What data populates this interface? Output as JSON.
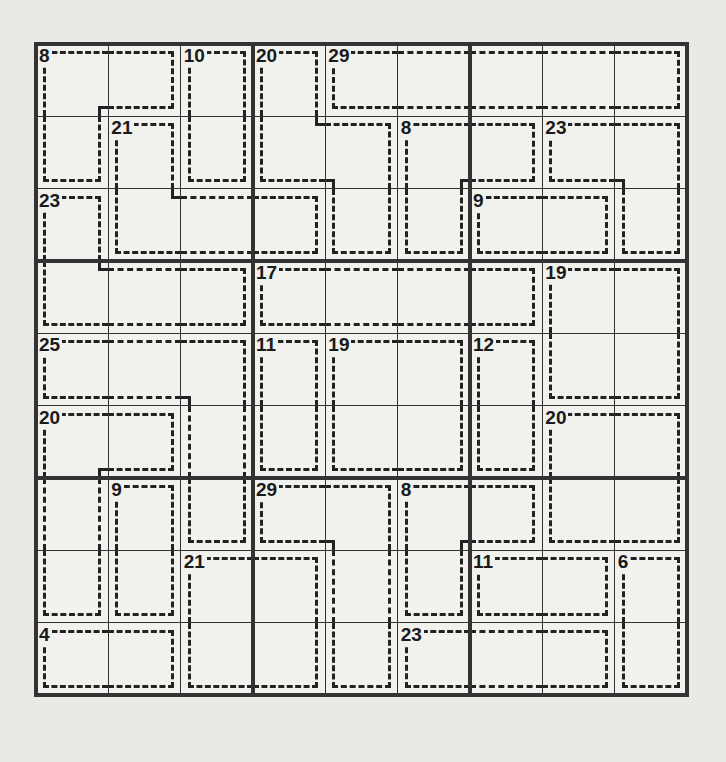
{
  "puzzle": {
    "type": "killer-sudoku",
    "size": 9,
    "cages": [
      {
        "id": "A",
        "sum": "8",
        "cells": [
          [
            0,
            0
          ],
          [
            0,
            1
          ],
          [
            1,
            0
          ]
        ]
      },
      {
        "id": "B",
        "sum": "10",
        "cells": [
          [
            0,
            2
          ],
          [
            1,
            2
          ]
        ]
      },
      {
        "id": "C",
        "sum": "20",
        "cells": [
          [
            0,
            3
          ],
          [
            1,
            3
          ],
          [
            1,
            4
          ],
          [
            2,
            4
          ]
        ]
      },
      {
        "id": "D",
        "sum": "29",
        "cells": [
          [
            0,
            4
          ],
          [
            0,
            5
          ],
          [
            0,
            6
          ],
          [
            0,
            7
          ],
          [
            0,
            8
          ]
        ]
      },
      {
        "id": "E",
        "sum": "21",
        "cells": [
          [
            1,
            1
          ],
          [
            2,
            1
          ],
          [
            2,
            2
          ],
          [
            2,
            3
          ]
        ]
      },
      {
        "id": "F",
        "sum": "8",
        "cells": [
          [
            1,
            5
          ],
          [
            1,
            6
          ],
          [
            2,
            5
          ]
        ]
      },
      {
        "id": "G",
        "sum": "23",
        "cells": [
          [
            1,
            7
          ],
          [
            1,
            8
          ],
          [
            2,
            8
          ]
        ]
      },
      {
        "id": "H",
        "sum": "23",
        "cells": [
          [
            2,
            0
          ],
          [
            3,
            0
          ],
          [
            3,
            1
          ],
          [
            3,
            2
          ]
        ]
      },
      {
        "id": "I",
        "sum": "9",
        "cells": [
          [
            2,
            6
          ],
          [
            2,
            7
          ]
        ]
      },
      {
        "id": "J",
        "sum": "17",
        "cells": [
          [
            3,
            3
          ],
          [
            3,
            4
          ],
          [
            3,
            5
          ],
          [
            3,
            6
          ]
        ]
      },
      {
        "id": "K",
        "sum": "19",
        "cells": [
          [
            3,
            7
          ],
          [
            3,
            8
          ],
          [
            4,
            7
          ],
          [
            4,
            8
          ]
        ]
      },
      {
        "id": "L",
        "sum": "25",
        "cells": [
          [
            4,
            0
          ],
          [
            4,
            1
          ],
          [
            4,
            2
          ],
          [
            5,
            2
          ],
          [
            6,
            2
          ]
        ]
      },
      {
        "id": "M",
        "sum": "11",
        "cells": [
          [
            4,
            3
          ],
          [
            5,
            3
          ]
        ]
      },
      {
        "id": "N",
        "sum": "19",
        "cells": [
          [
            4,
            4
          ],
          [
            4,
            5
          ],
          [
            5,
            4
          ],
          [
            5,
            5
          ]
        ]
      },
      {
        "id": "O",
        "sum": "12",
        "cells": [
          [
            4,
            6
          ],
          [
            5,
            6
          ]
        ]
      },
      {
        "id": "P",
        "sum": "20",
        "cells": [
          [
            5,
            0
          ],
          [
            5,
            1
          ],
          [
            6,
            0
          ],
          [
            7,
            0
          ]
        ]
      },
      {
        "id": "Q",
        "sum": "20",
        "cells": [
          [
            5,
            7
          ],
          [
            5,
            8
          ],
          [
            6,
            7
          ],
          [
            6,
            8
          ]
        ]
      },
      {
        "id": "R",
        "sum": "9",
        "cells": [
          [
            6,
            1
          ],
          [
            7,
            1
          ]
        ]
      },
      {
        "id": "S",
        "sum": "29",
        "cells": [
          [
            6,
            3
          ],
          [
            6,
            4
          ],
          [
            7,
            4
          ],
          [
            8,
            4
          ]
        ]
      },
      {
        "id": "T",
        "sum": "8",
        "cells": [
          [
            6,
            5
          ],
          [
            6,
            6
          ],
          [
            7,
            5
          ]
        ]
      },
      {
        "id": "U",
        "sum": "21",
        "cells": [
          [
            7,
            2
          ],
          [
            7,
            3
          ],
          [
            8,
            2
          ],
          [
            8,
            3
          ]
        ]
      },
      {
        "id": "V",
        "sum": "11",
        "cells": [
          [
            7,
            6
          ],
          [
            7,
            7
          ]
        ]
      },
      {
        "id": "W",
        "sum": "6",
        "cells": [
          [
            7,
            8
          ],
          [
            8,
            8
          ]
        ]
      },
      {
        "id": "X",
        "sum": "4",
        "cells": [
          [
            8,
            0
          ],
          [
            8,
            1
          ]
        ]
      },
      {
        "id": "Y",
        "sum": "23",
        "cells": [
          [
            8,
            5
          ],
          [
            8,
            6
          ],
          [
            8,
            7
          ]
        ]
      }
    ],
    "values": [
      [
        "",
        "",
        "",
        "",
        "",
        "",
        "",
        "",
        ""
      ],
      [
        "",
        "",
        "",
        "",
        "",
        "",
        "",
        "",
        ""
      ],
      [
        "",
        "",
        "",
        "",
        "",
        "",
        "",
        "",
        ""
      ],
      [
        "",
        "",
        "",
        "",
        "",
        "",
        "",
        "",
        ""
      ],
      [
        "",
        "",
        "",
        "",
        "",
        "",
        "",
        "",
        ""
      ],
      [
        "",
        "",
        "",
        "",
        "",
        "",
        "",
        "",
        ""
      ],
      [
        "",
        "",
        "",
        "",
        "",
        "",
        "",
        "",
        ""
      ],
      [
        "",
        "",
        "",
        "",
        "",
        "",
        "",
        "",
        ""
      ],
      [
        "",
        "",
        "",
        "",
        "",
        "",
        "",
        "",
        ""
      ]
    ]
  }
}
